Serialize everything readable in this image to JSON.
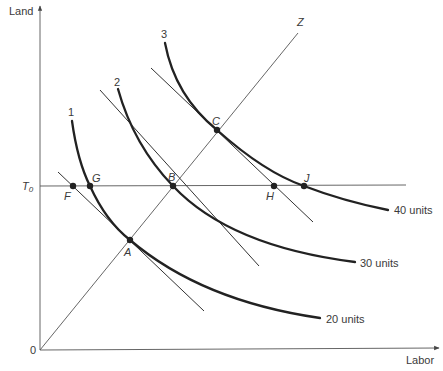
{
  "diagram": {
    "type": "isoquant",
    "axes": {
      "y_label": "Land",
      "x_label": "Labor",
      "origin_label": "0"
    },
    "land_constraint": {
      "label_main": "T",
      "label_sub": "0"
    },
    "expansion_path": {
      "label": "Z"
    },
    "isoquants": [
      {
        "id": "1",
        "number_label": "1",
        "output_label": "20 units"
      },
      {
        "id": "2",
        "number_label": "2",
        "output_label": "30 units"
      },
      {
        "id": "3",
        "number_label": "3",
        "output_label": "40 units"
      }
    ],
    "points": {
      "A": "A",
      "B": "B",
      "C": "C",
      "F": "F",
      "G": "G",
      "H": "H",
      "J": "J"
    },
    "colors": {
      "curve": "#222222",
      "line": "#555555",
      "text": "#3a3a3a",
      "background": "#ffffff"
    }
  }
}
